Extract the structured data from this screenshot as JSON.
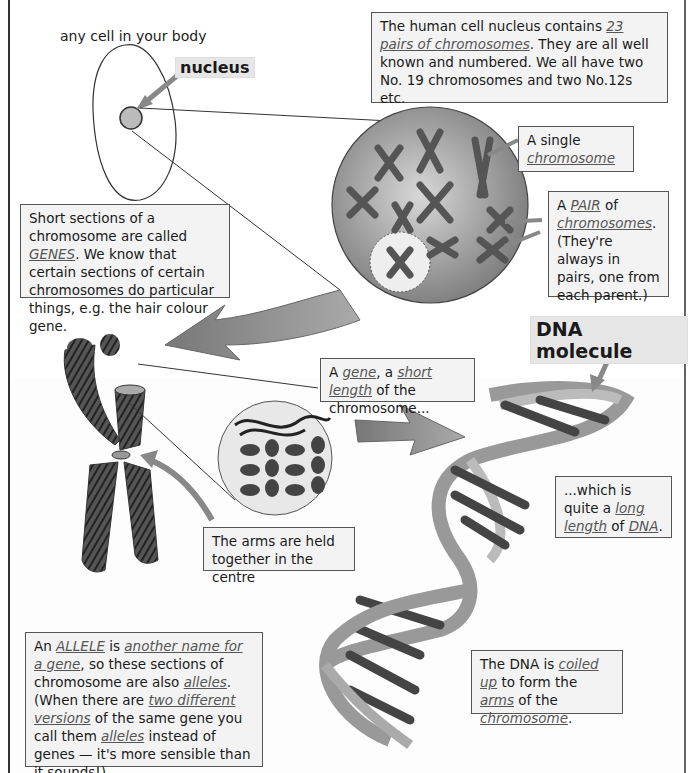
{
  "labels": {
    "cell": "any cell in your body",
    "nucleus": "nucleus",
    "dna_molecule": "DNA molecule"
  },
  "boxes": {
    "nucleus_info": {
      "t1": "The human cell nucleus contains ",
      "u1": "23 pairs of chromosomes",
      "t2": ".  They are all well known and numbered.  We all have two No. 19 chromosomes and two No.12s etc."
    },
    "single_chromosome": {
      "t1": "A single",
      "u1": "chromosome"
    },
    "pair": {
      "t1": "A ",
      "u1": "PAIR",
      "t2": " of ",
      "u2": "chromosomes",
      "t3": ". (They're always in pairs, one from each parent.)"
    },
    "genes": {
      "t1": "Short sections of a chromosome are called ",
      "u1": "GENES",
      "t2": ".  We know that certain sections of certain chromosomes do particular things, e.g. the hair colour gene."
    },
    "gene": {
      "t1": "A ",
      "u1": "gene",
      "t2": ", a ",
      "u2": "short length",
      "t3": " of the chromosome..."
    },
    "arms": {
      "t1": "The arms are held together in the centre"
    },
    "long_dna": {
      "t1": "...which is quite a ",
      "u1": "long length",
      "t2": " of ",
      "u2": "DNA",
      "t3": "."
    },
    "coiled": {
      "t1": "The DNA is ",
      "u1": "coiled up",
      "t2": " to form the ",
      "u2": "arms",
      "t3": " of the ",
      "u3": "chromosome",
      "t4": "."
    },
    "allele": {
      "t1": "An ",
      "u1": "ALLELE",
      "t2": " is ",
      "u2": "another name for a gene",
      "t3": ", so these sections of chromosome are also ",
      "u3": "alleles",
      "t4": ". (When there are ",
      "u4": "two different versions",
      "t5": " of the same gene you call them ",
      "u5": "alleles",
      "t6": " instead of genes — it's more sensible than it sounds!)"
    }
  },
  "colors": {
    "arrow": "#8a8a8a",
    "nucleus_fill": "#909090",
    "box_bg": "#f3f3f3",
    "underline_text": "#555555"
  }
}
